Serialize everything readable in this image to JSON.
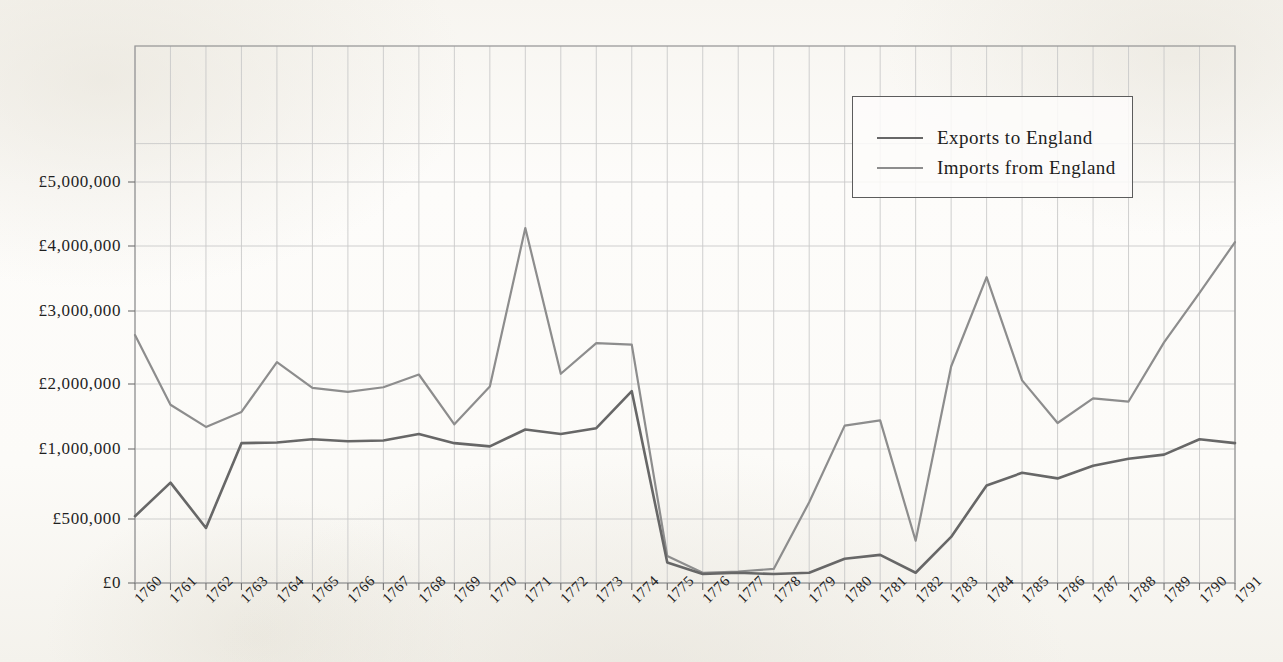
{
  "chart_data": {
    "type": "line",
    "title": "",
    "subtitle": "",
    "xlabel": "",
    "ylabel": "",
    "grid": true,
    "legend_position": "top-right",
    "currency_symbol": "£",
    "x": [
      1760,
      1761,
      1762,
      1763,
      1764,
      1765,
      1766,
      1767,
      1768,
      1769,
      1770,
      1771,
      1772,
      1773,
      1774,
      1775,
      1776,
      1777,
      1778,
      1779,
      1780,
      1781,
      1782,
      1783,
      1784,
      1785,
      1786,
      1787,
      1788,
      1789,
      1790,
      1791
    ],
    "categories": [
      "1760",
      "1761",
      "1762",
      "1763",
      "1764",
      "1765",
      "1766",
      "1767",
      "1768",
      "1769",
      "1770",
      "1771",
      "1772",
      "1773",
      "1774",
      "1775",
      "1776",
      "1777",
      "1778",
      "1779",
      "1780",
      "1781",
      "1782",
      "1783",
      "1784",
      "1785",
      "1786",
      "1787",
      "1788",
      "1789",
      "1790",
      "1791"
    ],
    "y_tick_values": [
      0,
      500000,
      1000000,
      2000000,
      3000000,
      4000000,
      5000000
    ],
    "y_tick_labels": [
      "£0",
      "£500,000",
      "£1,000,000",
      "£2,000,000",
      "£3,000,000",
      "£4,000,000",
      "£5,000,000"
    ],
    "ylim": [
      0,
      5600000
    ],
    "series": [
      {
        "name": "Exports to England",
        "color": "#676767",
        "values": [
          520000,
          760000,
          430000,
          1090000,
          1100000,
          1150000,
          1120000,
          1130000,
          1230000,
          1090000,
          1040000,
          1300000,
          1230000,
          1320000,
          1890000,
          160000,
          70000,
          80000,
          70000,
          80000,
          190000,
          220000,
          80000,
          360000,
          740000,
          830000,
          790000,
          880000,
          930000,
          960000,
          1150000,
          1090000
        ]
      },
      {
        "name": "Imports from England",
        "color": "#8d8d8d",
        "values": [
          2670000,
          1680000,
          1340000,
          1570000,
          2300000,
          1940000,
          1880000,
          1950000,
          2130000,
          1380000,
          1960000,
          4280000,
          2140000,
          2560000,
          2540000,
          210000,
          80000,
          90000,
          110000,
          620000,
          1360000,
          1440000,
          330000,
          2240000,
          3520000,
          2050000,
          1400000,
          1780000,
          1730000,
          2570000,
          3280000,
          4060000
        ]
      }
    ]
  },
  "legend": {
    "items": [
      {
        "label": "Exports to England",
        "color": "#676767"
      },
      {
        "label": "Imports from England",
        "color": "#8d8d8d"
      }
    ]
  },
  "axes": {
    "y_labels": [
      "£5,000,000",
      "£4,000,000",
      "£3,000,000",
      "£2,000,000",
      "£1,000,000",
      "£500,000",
      "£0"
    ],
    "x_labels": [
      "1760",
      "1761",
      "1762",
      "1763",
      "1764",
      "1765",
      "1766",
      "1767",
      "1768",
      "1769",
      "1770",
      "1771",
      "1772",
      "1773",
      "1774",
      "1775",
      "1776",
      "1777",
      "1778",
      "1779",
      "1780",
      "1781",
      "1782",
      "1783",
      "1784",
      "1785",
      "1786",
      "1787",
      "1788",
      "1789",
      "1790",
      "1791"
    ]
  },
  "style": {
    "background": "#fbfaf7",
    "grid_color": "#c9c9c9",
    "frame_color": "#9a9a9a",
    "text_color": "#1f1f1f"
  }
}
